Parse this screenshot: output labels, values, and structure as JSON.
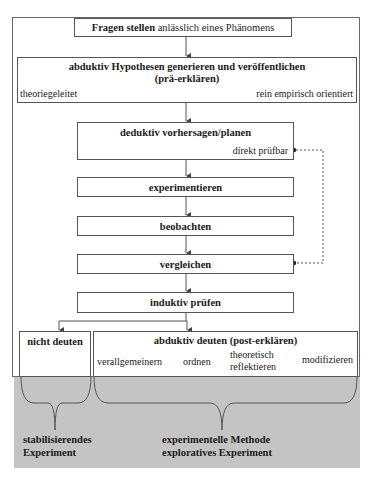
{
  "diagram": {
    "top_box": {
      "bold": "Fragen stellen",
      "normal": " anlässlich eines Phänomens"
    },
    "hypothesis_box": {
      "title_line1": "abduktiv  Hypothesen generieren und veröffentlichen",
      "title_line2": "(prä-erklären)",
      "left_label": "theoriegeleitet",
      "right_label": "rein empirisch orientiert"
    },
    "deductive_box": {
      "title": "deduktiv vorhersagen/planen",
      "sub_label": "direkt prüfbar"
    },
    "steps": [
      "experimentieren",
      "beobachten",
      "vergleichen",
      "induktiv prüfen"
    ],
    "not_interpret_box": {
      "title": "nicht deuten"
    },
    "abductive_interpret_box": {
      "title": "abduktiv  deuten (post-erklären)",
      "items": [
        "verallgemeinern",
        "ordnen",
        "theoretisch",
        "reflektieren",
        "modifizieren"
      ]
    },
    "bottom_labels": {
      "left_line1": "stabilisierendes",
      "left_line2": "Experiment",
      "right_line1": "experimentelle Methode",
      "right_line2": "exploratives Experiment"
    },
    "colors": {
      "gray_band": "#c4c4c4",
      "line": "#555555"
    }
  }
}
